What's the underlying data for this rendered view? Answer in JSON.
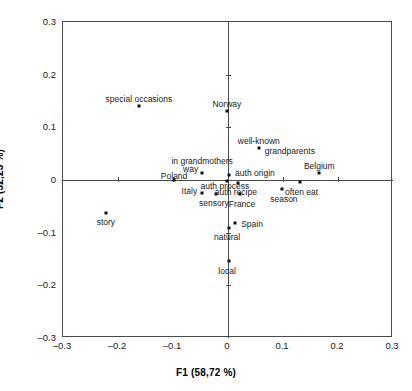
{
  "chart_data": {
    "type": "scatter",
    "title": "",
    "xlabel": "F1 (58,72 %)",
    "ylabel": "F2 (32,23 %)",
    "xlim": [
      -0.3,
      0.3
    ],
    "ylim": [
      -0.3,
      0.3
    ],
    "grid": false,
    "legend": "none",
    "xticks": [
      "-0.3",
      "-0.2",
      "-0.1",
      "0",
      "0.1",
      "0.2",
      "0.3"
    ],
    "xtick_values": [
      -0.3,
      -0.2,
      -0.1,
      0,
      0.1,
      0.2,
      0.3
    ],
    "yticks": [
      "0.3",
      "0.2",
      "0.1",
      "0",
      "-0.1",
      "-0.2",
      "-0.3"
    ],
    "ytick_values": [
      0.3,
      0.2,
      0.1,
      0,
      -0.1,
      -0.2,
      -0.3
    ],
    "points": [
      {
        "label": "special occasions",
        "x": -0.162,
        "y": 0.14,
        "lab_dx": 0,
        "lab_dy": -7,
        "align": "center"
      },
      {
        "label": "Norway",
        "x": -0.002,
        "y": 0.131,
        "lab_dx": 0,
        "lab_dy": -7,
        "align": "center"
      },
      {
        "label": "well-known",
        "x": 0.056,
        "y": 0.061,
        "lab_dx": 0,
        "lab_dy": -7,
        "align": "center"
      },
      {
        "label": "grandparents",
        "x": 0.056,
        "y": 0.061,
        "lab_dx": 6,
        "lab_dy": 3,
        "align": "left"
      },
      {
        "label": "Belgium",
        "x": 0.166,
        "y": 0.013,
        "lab_dx": 0,
        "lab_dy": -7,
        "align": "center"
      },
      {
        "label": "in grandmothers",
        "x": -0.047,
        "y": 0.013,
        "lab_dx": 0,
        "lab_dy": -12,
        "align": "center"
      },
      {
        "label": "way",
        "x": -0.047,
        "y": 0.013,
        "lab_dx": -4,
        "lab_dy": -4,
        "align": "right"
      },
      {
        "label": "auth origin",
        "x": 0.002,
        "y": 0.009,
        "lab_dx": 6,
        "lab_dy": -2,
        "align": "left"
      },
      {
        "label": "auth process",
        "x": -0.002,
        "y": -0.001,
        "lab_dx": -2,
        "lab_dy": 5,
        "align": "center"
      },
      {
        "label": "Poland",
        "x": -0.098,
        "y": 0.0,
        "lab_dx": 0,
        "lab_dy": -4,
        "align": "center"
      },
      {
        "label": "Italy",
        "x": -0.047,
        "y": -0.024,
        "lab_dx": -5,
        "lab_dy": -2,
        "align": "right"
      },
      {
        "label": "sensory",
        "x": -0.022,
        "y": -0.026,
        "lab_dx": -2,
        "lab_dy": 9,
        "align": "center"
      },
      {
        "label": "auth recipe",
        "x": 0.018,
        "y": -0.006,
        "lab_dx": -2,
        "lab_dy": 9,
        "align": "center"
      },
      {
        "label": "France",
        "x": 0.022,
        "y": -0.027,
        "lab_dx": 2,
        "lab_dy": 10,
        "align": "center"
      },
      {
        "label": "often eat",
        "x": 0.13,
        "y": -0.004,
        "lab_dx": 2,
        "lab_dy": 10,
        "align": "center"
      },
      {
        "label": "season",
        "x": 0.098,
        "y": -0.018,
        "lab_dx": 2,
        "lab_dy": 10,
        "align": "center"
      },
      {
        "label": "story",
        "x": -0.222,
        "y": -0.063,
        "lab_dx": 0,
        "lab_dy": 9,
        "align": "center"
      },
      {
        "label": "Spain",
        "x": 0.013,
        "y": -0.081,
        "lab_dx": 6,
        "lab_dy": 1,
        "align": "left"
      },
      {
        "label": "natural",
        "x": 0.002,
        "y": -0.091,
        "lab_dx": -2,
        "lab_dy": 9,
        "align": "center"
      },
      {
        "label": "local",
        "x": 0.002,
        "y": -0.153,
        "lab_dx": -2,
        "lab_dy": 10,
        "align": "center"
      }
    ]
  },
  "colors": {
    "point": "#111111",
    "axis": "#4a4a4a",
    "text": "#1a1a1a",
    "background": "#ffffff"
  }
}
